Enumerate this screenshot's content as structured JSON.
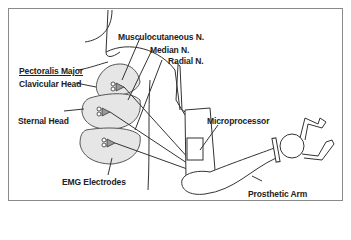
{
  "diagram": {
    "labels": {
      "musculocutaneous": "Musculocutaneous N.",
      "median": "Median N.",
      "radial": "Radial N.",
      "pectoralis_major": "Pectoralis Major",
      "clavicular_head": "Clavicular Head",
      "sternal_head": "Sternal Head",
      "microprocessor": "Microprocessor",
      "emg_electrodes": "EMG Electrodes",
      "prosthetic_arm": "Prosthetic Arm"
    },
    "colors": {
      "line": "#333333",
      "muscle_fill": "#e6e6e6",
      "electrode_fill": "#9a9a9a",
      "frame": "#8a8a8a"
    }
  }
}
